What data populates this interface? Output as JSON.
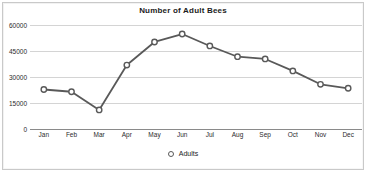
{
  "chart_data": {
    "type": "line",
    "title": "Number of Adult Bees",
    "xlabel": "",
    "ylabel": "",
    "categories": [
      "Jan",
      "Feb",
      "Mar",
      "Apr",
      "May",
      "Jun",
      "Jul",
      "Aug",
      "Sep",
      "Oct",
      "Nov",
      "Dec"
    ],
    "series": [
      {
        "name": "Adults",
        "values": [
          22800,
          21500,
          11000,
          36900,
          50200,
          54800,
          47900,
          41700,
          40400,
          33500,
          25800,
          23500
        ]
      }
    ],
    "ylim": [
      0,
      60000
    ],
    "yticks": [
      0,
      15000,
      30000,
      45000,
      60000
    ],
    "ytick_labels": [
      "0",
      "15000",
      "30000",
      "45000",
      "60000"
    ],
    "grid": true,
    "legend_position": "bottom",
    "marker": "open-circle",
    "line_color": "#595959",
    "marker_fill": "#ffffff",
    "marker_stroke": "#595959",
    "gridline_color": "#d4d4d4",
    "axis_color": "#8a8a8a",
    "title_color": "#1b1b1b",
    "background": "#ffffff"
  },
  "legend": {
    "entries": [
      {
        "label": "Adults",
        "marker": "open-circle-marker"
      }
    ]
  }
}
